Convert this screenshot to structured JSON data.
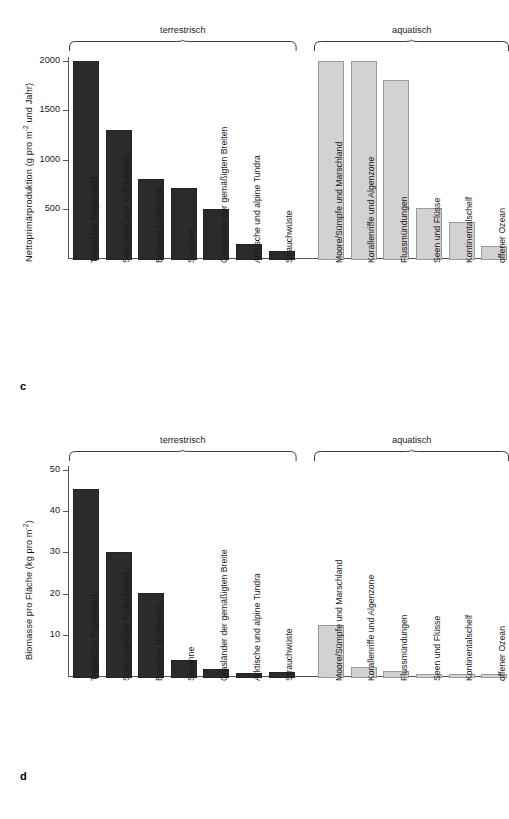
{
  "figure": {
    "panels": [
      {
        "letter": "c",
        "ylabel_text": "Nettoprimärproduktion (g pro m",
        "ylabel_sup": "-2",
        "ylabel_tail": " und Jahr)"
      },
      {
        "letter": "d",
        "ylabel_text": "Biomasse pro Fläche (kg pro m",
        "ylabel_sup": "-2",
        "ylabel_tail": ")"
      }
    ],
    "groups": [
      {
        "label": "terrestrisch"
      },
      {
        "label": "aquatisch"
      }
    ]
  },
  "chart_data": [
    {
      "type": "bar",
      "panel": "c",
      "title": "",
      "xlabel": "",
      "ylabel": "Nettoprimärproduktion (g pro m-2 und Jahr)",
      "ylim": [
        0,
        2100
      ],
      "yticks": [
        500,
        1000,
        1500,
        2000
      ],
      "ytick_labels": [
        "500",
        "1000",
        "1500",
        "2000"
      ],
      "grid": false,
      "legend": null,
      "group_annotations": [
        "terrestrisch",
        "aquatisch"
      ],
      "categories": [
        "Tropischer Regenwald",
        "Sommergrüner Falllaubwald",
        "Borealer Nadelwald",
        "Savanne",
        "Grasländer der gemäßigten Breiten",
        "Arktische und alpine Tundra",
        "Strauchwüste",
        "Moore/Sümpfe und Marschland",
        "Korallenriffe und Algenzone",
        "Flussmündungen",
        "Seen und Flüsse",
        "Kontinentalschelf",
        "offener Ozean"
      ],
      "groups": [
        "terrestrisch",
        "terrestrisch",
        "terrestrisch",
        "terrestrisch",
        "terrestrisch",
        "terrestrisch",
        "terrestrisch",
        "aquatisch",
        "aquatisch",
        "aquatisch",
        "aquatisch",
        "aquatisch",
        "aquatisch"
      ],
      "values": [
        2000,
        1300,
        800,
        710,
        500,
        140,
        70,
        2000,
        2000,
        1810,
        510,
        370,
        125
      ],
      "colors": {
        "terrestrisch": "#2b2b2b",
        "aquatisch": "#d2d2d2"
      }
    },
    {
      "type": "bar",
      "panel": "d",
      "title": "",
      "xlabel": "",
      "ylabel": "Biomasse pro Fläche (kg pro m-2)",
      "ylim": [
        0,
        52
      ],
      "yticks": [
        10,
        20,
        30,
        40,
        50
      ],
      "ytick_labels": [
        "10",
        "20",
        "30",
        "40",
        "50"
      ],
      "grid": false,
      "legend": null,
      "group_annotations": [
        "terrestrisch",
        "aquatisch"
      ],
      "categories": [
        "Tropischer Regenwald",
        "Sommergrüner Falllaubwald",
        "Borealer Nadelwald",
        "Savanne",
        "Grasländer der gemäßigten Breite",
        "Arktische und alpine Tundra",
        "Strauchwüste",
        "Moore/Sümpfe und Marschland",
        "Korallenriffe und Algenzone",
        "Flussmündungen",
        "Seen und Flüsse",
        "Kontinentalschelf",
        "offener Ozean"
      ],
      "groups": [
        "terrestrisch",
        "terrestrisch",
        "terrestrisch",
        "terrestrisch",
        "terrestrisch",
        "terrestrisch",
        "terrestrisch",
        "aquatisch",
        "aquatisch",
        "aquatisch",
        "aquatisch",
        "aquatisch",
        "aquatisch"
      ],
      "values": [
        45.3,
        30.2,
        20.1,
        4.0,
        1.6,
        0.8,
        1.0,
        12.3,
        2.2,
        1.2,
        0.6,
        0.3,
        0.3
      ],
      "colors": {
        "terrestrisch": "#2b2b2b",
        "aquatisch": "#d2d2d2"
      }
    }
  ]
}
